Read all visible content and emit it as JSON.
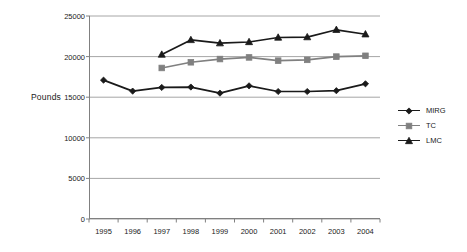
{
  "chart_data": {
    "type": "line",
    "title": "",
    "xlabel": "",
    "ylabel": "Pounds",
    "categories": [
      "1995",
      "1996",
      "1997",
      "1998",
      "1999",
      "2000",
      "2001",
      "2002",
      "2003",
      "2004"
    ],
    "ylim": [
      0,
      25000
    ],
    "y_ticks": [
      0,
      5000,
      10000,
      15000,
      20000,
      25000
    ],
    "y_tick_labels": [
      "0",
      "5000",
      "10000",
      "15000",
      "20000",
      "25000"
    ],
    "grid": "horizontal",
    "legend_position": "right",
    "series": [
      {
        "name": "MIRG",
        "marker": "diamond",
        "color": "#1a1a1a",
        "values": [
          17100,
          15750,
          16200,
          16250,
          15500,
          16400,
          15700,
          15700,
          15800,
          16650
        ]
      },
      {
        "name": "TC",
        "marker": "square",
        "color": "#808080",
        "values": [
          null,
          null,
          18600,
          19300,
          19700,
          19900,
          19500,
          19600,
          20000,
          20100
        ]
      },
      {
        "name": "LMC",
        "marker": "triangle",
        "color": "#1a1a1a",
        "values": [
          null,
          null,
          20250,
          22050,
          21650,
          21800,
          22350,
          22400,
          23300,
          22750
        ]
      }
    ]
  },
  "axis": {
    "y_title": "Pounds"
  },
  "legend": {
    "items": [
      {
        "label": "MIRG"
      },
      {
        "label": "TC"
      },
      {
        "label": "LMC"
      }
    ]
  },
  "colors": {
    "series_dark": "#1a1a1a",
    "series_gray": "#808080",
    "gridline": "#a6a6a6",
    "axis": "#808080",
    "background": "#ffffff"
  }
}
